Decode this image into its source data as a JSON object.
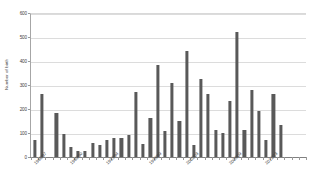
{
  "chart_data": {
    "type": "bar",
    "title": "",
    "xlabel": "",
    "ylabel": "Number of birth",
    "ylim": [
      0,
      600
    ],
    "yticks": [
      0,
      100,
      200,
      300,
      400,
      500,
      600
    ],
    "grid": true,
    "legend": false,
    "bar_color": "#595959",
    "categories": [
      "1986/87",
      "1987/88",
      "1988/89",
      "1989/90",
      "1990/91",
      "1991/92",
      "1992/93",
      "1993/94",
      "1994/95",
      "1995/96",
      "1996/97",
      "1997/98",
      "1998/99",
      "1999/00",
      "2000/01",
      "2001/02",
      "2002/03",
      "2003/04",
      "2004/05",
      "2005/06",
      "2006/07",
      "2007/08",
      "2008/09",
      "2009/10",
      "2010/11",
      "2011/12",
      "2012/13",
      "2013/14",
      "2014/15",
      "2015/16",
      "2016/17",
      "2017/18",
      "2018/19",
      "2019/20",
      "2020/21",
      "2021/22",
      "2022/23",
      "2023/24"
    ],
    "values": [
      70,
      262,
      0,
      185,
      95,
      40,
      25,
      25,
      58,
      52,
      70,
      80,
      78,
      92,
      272,
      55,
      162,
      385,
      108,
      308,
      148,
      443,
      48,
      325,
      262,
      112,
      98,
      232,
      520,
      112,
      280,
      190,
      70,
      262,
      135,
      0,
      0,
      0
    ],
    "xtick_labels": [
      {
        "index": 0,
        "text": "1986/87"
      },
      {
        "index": 5,
        "text": "1989/90"
      },
      {
        "index": 10,
        "text": "1993/94"
      },
      {
        "index": 16,
        "text": "1998/99"
      },
      {
        "index": 21,
        "text": "2002/03"
      },
      {
        "index": 27,
        "text": "2008/09"
      },
      {
        "index": 32,
        "text": "2012/13"
      }
    ]
  },
  "axis": {
    "y_title": "Number of birth"
  }
}
